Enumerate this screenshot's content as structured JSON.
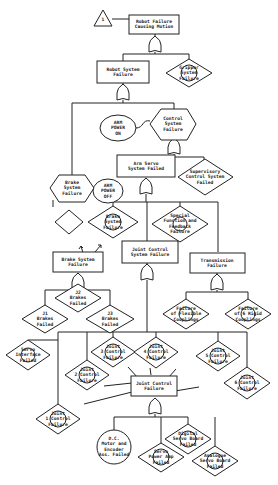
{
  "diagram": {
    "type": "fault-tree",
    "nodes": {
      "transfer": {
        "label": "1",
        "shape": "triangle"
      },
      "top": {
        "label": "Robot Failure\nCausing Motion",
        "shape": "rect"
      },
      "robot_sys": {
        "label": "Robot System\nFailure",
        "shape": "rect"
      },
      "gripper": {
        "label": "Gripper\nSystem\nFailure",
        "shape": "diamond"
      },
      "control_sys": {
        "label": "Control\nSystem\nFailure",
        "shape": "hexagon"
      },
      "arm_power_on": {
        "label": "ARM\nPOWER\nON",
        "shape": "oval"
      },
      "arm_servo": {
        "label": "Arm Servo\nSystem Failed",
        "shape": "rect"
      },
      "supervisory": {
        "label": "Supervisory\nControl System\nFailed",
        "shape": "diamond"
      },
      "brake_sys_hex": {
        "label": "Brake\nSystem\nFailure",
        "shape": "hexagon"
      },
      "arm_power_off": {
        "label": "ARM\nPOWER\nOFF",
        "shape": "oval"
      },
      "blank_diamond": {
        "label": "",
        "shape": "diamond"
      },
      "brake_sys_dia": {
        "label": "Brake\nSystem\nFailure",
        "shape": "diamond"
      },
      "special_func": {
        "label": "Special\nFunction and\nFeedback\nFailure",
        "shape": "diamond"
      },
      "brake_sys_rect": {
        "label": "Brake System\nFailure",
        "shape": "rect"
      },
      "joint_ctrl_sys": {
        "label": "Joint Control\nSystem Failure",
        "shape": "rect"
      },
      "transmission": {
        "label": "Transmission\nFailure",
        "shape": "rect"
      },
      "j2": {
        "label": "J2\nBrakes\nFailed",
        "shape": "diamond"
      },
      "j1": {
        "label": "J1\nBrakes\nFailed",
        "shape": "diamond"
      },
      "j3": {
        "label": "J3\nBrakes\nFailed",
        "shape": "diamond"
      },
      "flex_coupling": {
        "label": "Failure\nof Flexible\nCouplings",
        "shape": "diamond"
      },
      "rigid_coupling": {
        "label": "Failure\nof 6 Rigid\nCouplings",
        "shape": "diamond"
      },
      "servo_iface": {
        "label": "Servo\nInterface\nFailed",
        "shape": "diamond"
      },
      "joint3": {
        "label": "Joint\n3 Control\nFailure",
        "shape": "diamond"
      },
      "joint4": {
        "label": "Joint\n4 Control\nFailure",
        "shape": "diamond"
      },
      "joint5": {
        "label": "Joint\n5 Control\nFailure",
        "shape": "diamond"
      },
      "joint2": {
        "label": "Joint\n2 Control\nFailure",
        "shape": "diamond"
      },
      "joint6": {
        "label": "Joint\n6 Control\nFailure",
        "shape": "diamond"
      },
      "joint1": {
        "label": "Joint\n1 Control\nFailure",
        "shape": "diamond"
      },
      "joint_ctrl": {
        "label": "Joint Control\nFailure",
        "shape": "rect"
      },
      "dc_motor": {
        "label": "D.C.\nMotor and\nEncoder\nAss. Failed",
        "shape": "circle"
      },
      "servo_power": {
        "label": "Servo\nPower Amp\nFailed",
        "shape": "diamond"
      },
      "digital_servo": {
        "label": "Digital\nServo Board\nFailed",
        "shape": "diamond"
      },
      "analogue_servo": {
        "label": "Analogue\nServo Board\nFailed",
        "shape": "diamond"
      }
    }
  }
}
